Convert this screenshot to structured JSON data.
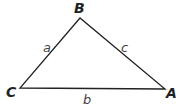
{
  "diagram": {
    "type": "triangle",
    "vertices": [
      {
        "label": "B",
        "x": 80,
        "y": 18
      },
      {
        "label": "C",
        "x": 20,
        "y": 88
      },
      {
        "label": "A",
        "x": 165,
        "y": 89
      }
    ],
    "sides": [
      {
        "label": "a",
        "between": [
          "B",
          "C"
        ]
      },
      {
        "label": "c",
        "between": [
          "B",
          "A"
        ]
      },
      {
        "label": "b",
        "between": [
          "C",
          "A"
        ]
      }
    ],
    "line_color": "#222222"
  }
}
